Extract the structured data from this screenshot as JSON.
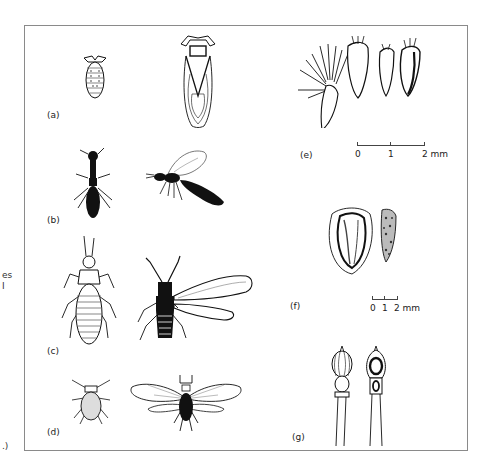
{
  "figure": {
    "left_margin_fragments": [
      "es",
      "I",
      ".)"
    ],
    "panels": [
      {
        "id": "a",
        "label": "(a)",
        "content": "insect nymph and winged adult (dorsal view)"
      },
      {
        "id": "b",
        "label": "(b)",
        "content": "ant-like wingless insect and winged wasp (lateral view)"
      },
      {
        "id": "c",
        "label": "(c)",
        "content": "larva and winged adult insect"
      },
      {
        "id": "d",
        "label": "(d)",
        "content": "aphid wingless and winged forms"
      },
      {
        "id": "e",
        "label": "(e)",
        "content": "achenes with pappus",
        "scale": {
          "ticks": [
            "0",
            "1",
            "2 mm"
          ]
        }
      },
      {
        "id": "f",
        "label": "(f)",
        "content": "seed / fruit, two views",
        "scale": {
          "ticks": [
            "0",
            "1",
            "2 mm"
          ]
        }
      },
      {
        "id": "g",
        "label": "(g)",
        "content": "fruit capsule exterior and cross-section"
      }
    ],
    "colors": {
      "ink": "#111111",
      "frame": "#8a8a8a",
      "background": "#ffffff"
    }
  }
}
